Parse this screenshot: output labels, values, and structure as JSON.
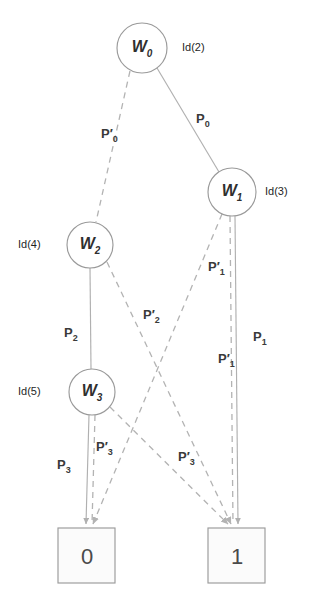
{
  "diagram": {
    "type": "binary-decision-diagram",
    "nodes": [
      {
        "id": "w0",
        "label": "W",
        "sub": "0",
        "id_label": "Id(2)",
        "cx": 142,
        "cy": 48,
        "r": 25
      },
      {
        "id": "w1",
        "label": "W",
        "sub": "1",
        "id_label": "Id(3)",
        "cx": 232,
        "cy": 192,
        "r": 24
      },
      {
        "id": "w2",
        "label": "W",
        "sub": "2",
        "id_label": "Id(4)",
        "cx": 90,
        "cy": 245,
        "r": 23
      },
      {
        "id": "w3",
        "label": "W",
        "sub": "3",
        "id_label": "Id(5)",
        "cx": 92,
        "cy": 392,
        "r": 23
      }
    ],
    "terminals": [
      {
        "id": "t0",
        "label": "0",
        "x": 58,
        "y": 528,
        "w": 57,
        "h": 55
      },
      {
        "id": "t1",
        "label": "1",
        "x": 208,
        "y": 528,
        "w": 57,
        "h": 55
      }
    ],
    "edges": [
      {
        "id": "e_p0",
        "label": "P",
        "sub": "0",
        "prime": false,
        "style": "solid",
        "from": "w0",
        "to": "w1"
      },
      {
        "id": "e_p0p",
        "label": "P",
        "sub": "0",
        "prime": true,
        "style": "dashed",
        "from": "w0",
        "to": "w2"
      },
      {
        "id": "e_p1",
        "label": "P",
        "sub": "1",
        "prime": false,
        "style": "solid",
        "from": "w1",
        "to": "t1"
      },
      {
        "id": "e_p1p_a",
        "label": "P",
        "sub": "1",
        "prime": true,
        "style": "dashed",
        "from": "w1",
        "to": "t0"
      },
      {
        "id": "e_p1p_b",
        "label": "P",
        "sub": "1",
        "prime": true,
        "style": "dashed",
        "from": "w1",
        "to": "t1"
      },
      {
        "id": "e_p2",
        "label": "P",
        "sub": "2",
        "prime": false,
        "style": "solid",
        "from": "w2",
        "to": "w3"
      },
      {
        "id": "e_p2p",
        "label": "P",
        "sub": "2",
        "prime": true,
        "style": "dashed",
        "from": "w2",
        "to": "t1"
      },
      {
        "id": "e_p3",
        "label": "P",
        "sub": "3",
        "prime": false,
        "style": "solid",
        "from": "w3",
        "to": "t0"
      },
      {
        "id": "e_p3p_a",
        "label": "P",
        "sub": "3",
        "prime": true,
        "style": "dashed",
        "from": "w3",
        "to": "t0"
      },
      {
        "id": "e_p3p_b",
        "label": "P",
        "sub": "3",
        "prime": true,
        "style": "dashed",
        "from": "w3",
        "to": "t1"
      }
    ],
    "edge_labels": {
      "p0": {
        "text": "P",
        "sub": "0",
        "prime": false,
        "x": 196,
        "y": 112
      },
      "p0p": {
        "text": "P",
        "sub": "0",
        "prime": true,
        "x": 101,
        "y": 127
      },
      "p1": {
        "text": "P",
        "sub": "1",
        "prime": false,
        "x": 253,
        "y": 330
      },
      "p1p_up": {
        "text": "P",
        "sub": "1",
        "prime": true,
        "x": 208,
        "y": 260
      },
      "p1p_dn": {
        "text": "P",
        "sub": "1",
        "prime": true,
        "x": 226,
        "y": 352
      },
      "p2": {
        "text": "P",
        "sub": "2",
        "prime": false,
        "x": 72,
        "y": 326
      },
      "p2p": {
        "text": "P",
        "sub": "2",
        "prime": true,
        "x": 150,
        "y": 316
      },
      "p3": {
        "text": "P",
        "sub": "3",
        "prime": false,
        "x": 62,
        "y": 462
      },
      "p3p_l": {
        "text": "P",
        "sub": "3",
        "prime": true,
        "x": 103,
        "y": 444
      },
      "p3p_r": {
        "text": "P",
        "sub": "3",
        "prime": true,
        "x": 186,
        "y": 455
      }
    },
    "colors": {
      "node_stroke": "#9a9a9a",
      "edge_solid": "#b0b0b0",
      "edge_dashed": "#b3b3b3",
      "text": "#2f2f2f",
      "background": "#ffffff"
    }
  }
}
